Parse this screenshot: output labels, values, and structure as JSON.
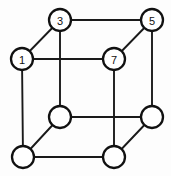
{
  "diagram": {
    "type": "graph",
    "width": 171,
    "height": 176,
    "background_color": "#fdfdfd",
    "edge_color": "#1a1a1a",
    "node_fill_color": "#ffffff",
    "node_stroke_color": "#111111",
    "label_color": "#111111",
    "node_radius": 11,
    "nodes": [
      {
        "id": "n1",
        "label": "1",
        "x": 22,
        "y": 59,
        "labeled": true
      },
      {
        "id": "n3",
        "label": "3",
        "x": 60,
        "y": 20,
        "labeled": true
      },
      {
        "id": "n5",
        "label": "5",
        "x": 152,
        "y": 20,
        "labeled": true
      },
      {
        "id": "n7",
        "label": "7",
        "x": 114,
        "y": 59,
        "labeled": true
      },
      {
        "id": "n2",
        "label": "",
        "x": 23,
        "y": 157,
        "labeled": false
      },
      {
        "id": "n4",
        "label": "",
        "x": 60,
        "y": 117,
        "labeled": false
      },
      {
        "id": "n6",
        "label": "",
        "x": 152,
        "y": 117,
        "labeled": false
      },
      {
        "id": "n8",
        "label": "",
        "x": 114,
        "y": 157,
        "labeled": false
      }
    ],
    "edges": [
      {
        "from": "n3",
        "to": "n5",
        "x1": 60,
        "y1": 20,
        "x2": 152,
        "y2": 20
      },
      {
        "from": "n5",
        "to": "n6",
        "x1": 152,
        "y1": 20,
        "x2": 152,
        "y2": 117
      },
      {
        "from": "n6",
        "to": "n4",
        "x1": 152,
        "y1": 117,
        "x2": 60,
        "y2": 117
      },
      {
        "from": "n4",
        "to": "n3",
        "x1": 60,
        "y1": 117,
        "x2": 60,
        "y2": 20
      },
      {
        "from": "n1",
        "to": "n7",
        "x1": 22,
        "y1": 59,
        "x2": 114,
        "y2": 59
      },
      {
        "from": "n7",
        "to": "n8",
        "x1": 114,
        "y1": 59,
        "x2": 114,
        "y2": 157
      },
      {
        "from": "n8",
        "to": "n2",
        "x1": 114,
        "y1": 157,
        "x2": 23,
        "y2": 157
      },
      {
        "from": "n2",
        "to": "n1",
        "x1": 23,
        "y1": 157,
        "x2": 22,
        "y2": 59
      },
      {
        "from": "n1",
        "to": "n3",
        "x1": 22,
        "y1": 59,
        "x2": 60,
        "y2": 20
      },
      {
        "from": "n7",
        "to": "n5",
        "x1": 114,
        "y1": 59,
        "x2": 152,
        "y2": 20
      },
      {
        "from": "n2",
        "to": "n4",
        "x1": 23,
        "y1": 157,
        "x2": 60,
        "y2": 117
      },
      {
        "from": "n8",
        "to": "n6",
        "x1": 114,
        "y1": 157,
        "x2": 152,
        "y2": 117
      }
    ]
  }
}
